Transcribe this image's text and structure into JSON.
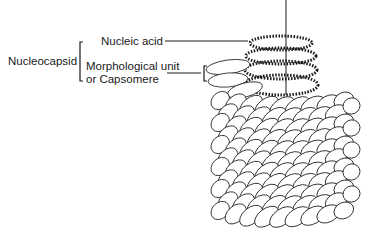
{
  "diagram": {
    "group_label": "Nucleocapsid",
    "labels": {
      "nucleic_acid": "Nucleic acid",
      "capsomere_line1": "Morphological unit",
      "capsomere_line2": "or Capsomere"
    },
    "colors": {
      "line": "#1a1a1a",
      "background": "#ffffff"
    }
  }
}
